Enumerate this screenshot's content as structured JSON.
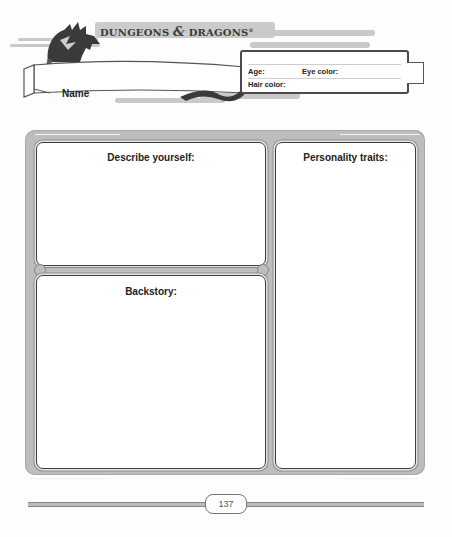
{
  "header": {
    "logo": {
      "word1": "DUNGEONS",
      "ampersand": "&",
      "word2": "DRAGONS",
      "trademark": "®"
    },
    "name_label": "Name",
    "info": {
      "age_label": "Age:",
      "eye_color_label": "Eye color:",
      "hair_color_label": "Hair color:"
    }
  },
  "panels": {
    "describe": {
      "title": "Describe yourself:"
    },
    "backstory": {
      "title": "Backstory:"
    },
    "personality": {
      "title": "Personality traits:"
    }
  },
  "footer": {
    "page_number": "137"
  },
  "colors": {
    "frame": "#bdbdbd",
    "border": "#3c3c3c",
    "text": "#222222",
    "dragon": "#3a3a3a"
  }
}
